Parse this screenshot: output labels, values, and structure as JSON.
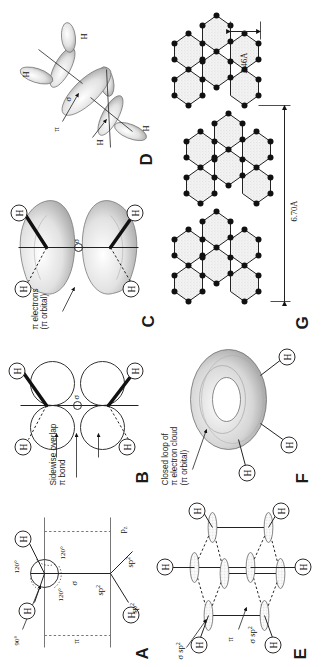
{
  "figure": {
    "orientation": "rotated-90-ccw",
    "background": "#ffffff",
    "ink": "#1a1a1a"
  },
  "panels": [
    {
      "id": "A",
      "label": "A",
      "angles": [
        "90°",
        "120°",
        "120°",
        "120°"
      ],
      "orbital_labels": [
        "π",
        "σ",
        "sp",
        "sp",
        "sp",
        "p"
      ],
      "sp_label": "sp",
      "sp_sup": "2",
      "pz_label": "p",
      "pz_sub": "z",
      "pi_label": "π",
      "sigma_label": "σ",
      "atoms": [
        "H",
        "H",
        "H"
      ]
    },
    {
      "id": "B",
      "label": "B",
      "caption": "Sidewise overlap\nπ bond",
      "sigma_label": "σ",
      "atoms": [
        "H",
        "H",
        "H",
        "H"
      ]
    },
    {
      "id": "C",
      "label": "C",
      "caption": "π electrons\n(π orbital)",
      "sigma_label": "σ",
      "atoms": [
        "H",
        "H",
        "H",
        "H"
      ]
    },
    {
      "id": "D",
      "label": "D",
      "pi_label": "π",
      "sigma_label": "σ",
      "atoms": [
        "H",
        "H",
        "H",
        "H"
      ]
    },
    {
      "id": "E",
      "label": "E",
      "sigma_sp2_top": "σ sp",
      "sigma_sp2_bottom": "σ sp",
      "sp_sup": "2",
      "pi_label": "π",
      "atoms": [
        "H",
        "H",
        "H",
        "H",
        "H",
        "H"
      ]
    },
    {
      "id": "F",
      "label": "F",
      "caption": "Closed loop of\nπ electron cloud\n(π orbital)",
      "atoms": [
        "H",
        "H",
        "H"
      ]
    },
    {
      "id": "G",
      "label": "G",
      "dimensions": [
        {
          "name": "interlayer-spacing",
          "value": "6.70Å"
        },
        {
          "name": "bond-lattice-spacing",
          "value": "2.46Å"
        }
      ],
      "layers": 3
    }
  ]
}
